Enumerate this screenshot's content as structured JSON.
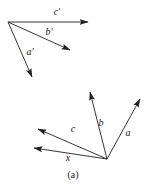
{
  "figure": {
    "caption": "(a)",
    "caption_pos": {
      "x": 73,
      "y": 175
    },
    "background_color": "#ffffff",
    "stroke_color": "#231f20",
    "label_color": "#1a1a1a",
    "width": 145,
    "height": 191
  },
  "groups": [
    {
      "name": "primed-vector-group",
      "origin": {
        "x": 8,
        "y": 22
      },
      "vectors": [
        {
          "id": "c-prime",
          "label": "c′",
          "from": {
            "x": 8,
            "y": 22
          },
          "to": {
            "x": 88,
            "y": 22
          },
          "label_pos": {
            "x": 57,
            "y": 12
          }
        },
        {
          "id": "b-prime",
          "label": "b′",
          "from": {
            "x": 8,
            "y": 22
          },
          "to": {
            "x": 70,
            "y": 50
          },
          "label_pos": {
            "x": 49,
            "y": 32
          }
        },
        {
          "id": "a-prime",
          "label": "a′",
          "from": {
            "x": 8,
            "y": 22
          },
          "to": {
            "x": 32,
            "y": 77
          },
          "label_pos": {
            "x": 30,
            "y": 52
          }
        }
      ]
    },
    {
      "name": "unprimed-vector-group",
      "origin": {
        "x": 107,
        "y": 159
      },
      "vectors": [
        {
          "id": "a",
          "label": "a",
          "from": {
            "x": 107,
            "y": 159
          },
          "to": {
            "x": 140,
            "y": 99
          },
          "label_pos": {
            "x": 128,
            "y": 133
          }
        },
        {
          "id": "b",
          "label": "b",
          "from": {
            "x": 107,
            "y": 159
          },
          "to": {
            "x": 90,
            "y": 92
          },
          "label_pos": {
            "x": 101,
            "y": 123
          }
        },
        {
          "id": "c",
          "label": "c",
          "from": {
            "x": 107,
            "y": 159
          },
          "to": {
            "x": 38,
            "y": 129
          },
          "label_pos": {
            "x": 73,
            "y": 129
          }
        },
        {
          "id": "x",
          "label": "x",
          "from": {
            "x": 107,
            "y": 159
          },
          "to": {
            "x": 34,
            "y": 148
          },
          "label_pos": {
            "x": 68,
            "y": 158
          }
        }
      ]
    }
  ]
}
